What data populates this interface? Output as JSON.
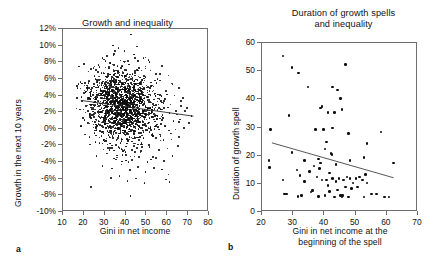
{
  "figure": {
    "panel_letters": {
      "a": "a",
      "b": "b"
    }
  },
  "chart_data": [
    {
      "type": "scatter",
      "panel": "a",
      "title": "Growth and inequality",
      "xlabel": "Gini in net income",
      "ylabel": "Growth in the next 10 years",
      "xlim": [
        10,
        80
      ],
      "ylim": [
        -10,
        12
      ],
      "grid": false,
      "legend": "none",
      "xticks": [
        10,
        20,
        30,
        40,
        50,
        60,
        70,
        80
      ],
      "xticklabels": [
        "10",
        "20",
        "30",
        "40",
        "50",
        "60",
        "70",
        "80"
      ],
      "yticks": [
        -10,
        -8,
        -6,
        -4,
        -2,
        0,
        2,
        4,
        6,
        8,
        10,
        12
      ],
      "yticklabels": [
        "-10%",
        "-8%",
        "-6%",
        "-4%",
        "-2%",
        "0%",
        "2%",
        "4%",
        "6%",
        "8%",
        "10%",
        "12%"
      ],
      "trendline": {
        "x": [
          19,
          73
        ],
        "y": [
          3.3,
          1.4
        ]
      },
      "point_count_approx": 1600,
      "cloud": {
        "x_center": 39,
        "x_spread": 8.5,
        "x_min": 17,
        "x_max": 73,
        "y_center": 2.4,
        "y_spread": 2.2,
        "y_min": -8.2,
        "y_max": 11.2
      },
      "points": [
        [
          43.0,
          11.2
        ],
        [
          34.5,
          9.9
        ],
        [
          37.0,
          9.6
        ],
        [
          46.0,
          9.8
        ],
        [
          30.0,
          8.2
        ],
        [
          31.5,
          8.6
        ],
        [
          35.0,
          8.9
        ],
        [
          40.0,
          9.2
        ],
        [
          44.5,
          8.8
        ],
        [
          49.0,
          8.4
        ],
        [
          28.0,
          7.3
        ],
        [
          33.0,
          7.8
        ],
        [
          38.0,
          8.1
        ],
        [
          42.0,
          7.6
        ],
        [
          47.0,
          7.2
        ],
        [
          52.0,
          7.9
        ],
        [
          58.0,
          7.4
        ],
        [
          25.5,
          6.2
        ],
        [
          29.0,
          6.6
        ],
        [
          36.0,
          6.9
        ],
        [
          41.0,
          6.4
        ],
        [
          45.0,
          6.8
        ],
        [
          50.0,
          6.1
        ],
        [
          55.0,
          6.5
        ],
        [
          61.0,
          6.3
        ],
        [
          22.0,
          5.1
        ],
        [
          27.0,
          5.6
        ],
        [
          32.0,
          5.4
        ],
        [
          39.0,
          5.8
        ],
        [
          43.5,
          5.2
        ],
        [
          48.0,
          5.5
        ],
        [
          53.0,
          5.0
        ],
        [
          57.0,
          5.7
        ],
        [
          63.0,
          5.3
        ],
        [
          66.0,
          4.8
        ],
        [
          20.5,
          4.2
        ],
        [
          24.0,
          4.6
        ],
        [
          28.5,
          4.4
        ],
        [
          33.5,
          4.9
        ],
        [
          38.5,
          4.3
        ],
        [
          42.5,
          4.7
        ],
        [
          47.5,
          4.1
        ],
        [
          51.0,
          4.5
        ],
        [
          56.0,
          4.0
        ],
        [
          60.0,
          4.4
        ],
        [
          64.0,
          3.9
        ],
        [
          68.0,
          3.6
        ],
        [
          19.5,
          3.2
        ],
        [
          23.0,
          3.6
        ],
        [
          26.5,
          3.4
        ],
        [
          30.5,
          3.8
        ],
        [
          34.0,
          3.1
        ],
        [
          37.5,
          3.5
        ],
        [
          41.5,
          3.3
        ],
        [
          45.5,
          3.7
        ],
        [
          49.5,
          3.0
        ],
        [
          54.0,
          3.4
        ],
        [
          59.0,
          3.2
        ],
        [
          62.0,
          2.8
        ],
        [
          67.0,
          2.6
        ],
        [
          70.0,
          2.4
        ],
        [
          18.5,
          2.2
        ],
        [
          21.5,
          2.6
        ],
        [
          25.0,
          2.4
        ],
        [
          29.5,
          2.8
        ],
        [
          32.5,
          2.1
        ],
        [
          36.5,
          2.5
        ],
        [
          40.5,
          2.3
        ],
        [
          44.0,
          2.7
        ],
        [
          48.5,
          2.0
        ],
        [
          52.5,
          2.4
        ],
        [
          57.5,
          2.2
        ],
        [
          61.5,
          1.8
        ],
        [
          65.0,
          1.6
        ],
        [
          69.0,
          2.0
        ],
        [
          72.0,
          1.4
        ],
        [
          20.0,
          1.2
        ],
        [
          24.5,
          1.6
        ],
        [
          27.5,
          1.4
        ],
        [
          31.0,
          1.8
        ],
        [
          35.5,
          1.1
        ],
        [
          39.5,
          1.5
        ],
        [
          43.0,
          1.3
        ],
        [
          46.5,
          1.7
        ],
        [
          50.5,
          1.0
        ],
        [
          54.5,
          1.4
        ],
        [
          58.5,
          1.2
        ],
        [
          63.5,
          0.8
        ],
        [
          66.5,
          1.0
        ],
        [
          71.0,
          0.6
        ],
        [
          19.0,
          0.2
        ],
        [
          22.5,
          0.6
        ],
        [
          26.0,
          0.4
        ],
        [
          30.0,
          0.8
        ],
        [
          34.5,
          0.1
        ],
        [
          38.0,
          0.5
        ],
        [
          42.0,
          0.3
        ],
        [
          46.0,
          0.7
        ],
        [
          51.5,
          0.0
        ],
        [
          55.5,
          0.4
        ],
        [
          59.5,
          0.2
        ],
        [
          64.5,
          -0.2
        ],
        [
          68.5,
          0.0
        ],
        [
          21.0,
          -0.8
        ],
        [
          25.5,
          -0.6
        ],
        [
          29.0,
          -1.0
        ],
        [
          33.0,
          -0.4
        ],
        [
          37.0,
          -0.9
        ],
        [
          41.0,
          -0.7
        ],
        [
          45.0,
          -1.2
        ],
        [
          49.0,
          -0.5
        ],
        [
          53.5,
          -1.0
        ],
        [
          57.0,
          -0.8
        ],
        [
          62.5,
          -1.4
        ],
        [
          66.0,
          -1.1
        ],
        [
          23.5,
          -2.0
        ],
        [
          28.0,
          -1.8
        ],
        [
          32.0,
          -2.4
        ],
        [
          36.0,
          -2.1
        ],
        [
          40.0,
          -2.6
        ],
        [
          44.5,
          -2.2
        ],
        [
          48.0,
          -2.8
        ],
        [
          52.0,
          -2.3
        ],
        [
          56.5,
          -2.7
        ],
        [
          60.5,
          -2.5
        ],
        [
          65.5,
          -2.2
        ],
        [
          26.5,
          -3.4
        ],
        [
          31.5,
          -3.1
        ],
        [
          35.0,
          -3.7
        ],
        [
          39.0,
          -3.3
        ],
        [
          43.5,
          -3.9
        ],
        [
          47.0,
          -3.5
        ],
        [
          51.0,
          -4.1
        ],
        [
          55.0,
          -3.6
        ],
        [
          59.0,
          -4.0
        ],
        [
          63.0,
          -3.4
        ],
        [
          29.5,
          -4.6
        ],
        [
          34.0,
          -4.9
        ],
        [
          38.5,
          -4.4
        ],
        [
          42.5,
          -5.1
        ],
        [
          46.5,
          -4.7
        ],
        [
          50.0,
          -5.3
        ],
        [
          54.0,
          -4.8
        ],
        [
          58.0,
          -5.0
        ],
        [
          61.0,
          -5.6
        ],
        [
          33.5,
          -6.0
        ],
        [
          37.5,
          -5.8
        ],
        [
          41.5,
          -6.4
        ],
        [
          45.5,
          -6.1
        ],
        [
          49.5,
          -6.6
        ],
        [
          60.0,
          -6.2
        ],
        [
          61.5,
          -6.5
        ],
        [
          24.0,
          -7.1
        ],
        [
          42.8,
          -8.2
        ]
      ]
    },
    {
      "type": "scatter",
      "panel": "b",
      "title": "Duration of growth spells and inequality",
      "title_lines": [
        "Duration of growth spells",
        "and inequality"
      ],
      "xlabel": "Gini in net income at the beginning of the spell",
      "xlabel_lines": [
        "Gini in net income at the",
        "beginning of the spell"
      ],
      "ylabel": "Duration of growth spell",
      "xlim": [
        20,
        70
      ],
      "ylim": [
        0,
        60
      ],
      "grid": false,
      "legend": "none",
      "xticks": [
        20,
        30,
        40,
        50,
        60,
        70
      ],
      "xticklabels": [
        "20",
        "30",
        "40",
        "50",
        "60",
        "70"
      ],
      "yticks": [
        0,
        10,
        20,
        30,
        40,
        50,
        60
      ],
      "yticklabels": [
        "0",
        "10",
        "20",
        "30",
        "40",
        "50",
        "60"
      ],
      "trendline": {
        "x": [
          23.5,
          62.5
        ],
        "y": [
          24.2,
          11.8
        ]
      },
      "points": [
        [
          27.0,
          55.0
        ],
        [
          30.0,
          51.0
        ],
        [
          32.0,
          49.0
        ],
        [
          47.0,
          52.0
        ],
        [
          35.0,
          44.0
        ],
        [
          43.0,
          44.0
        ],
        [
          44.5,
          43.0
        ],
        [
          45.5,
          40.0
        ],
        [
          29.0,
          34.0
        ],
        [
          39.0,
          36.5
        ],
        [
          39.5,
          37.0
        ],
        [
          41.5,
          35.0
        ],
        [
          43.5,
          35.0
        ],
        [
          46.0,
          36.0
        ],
        [
          23.0,
          29.0
        ],
        [
          37.5,
          29.0
        ],
        [
          40.0,
          29.0
        ],
        [
          43.0,
          29.5
        ],
        [
          48.0,
          27.5
        ],
        [
          58.5,
          28.0
        ],
        [
          41.0,
          24.5
        ],
        [
          54.0,
          24.0
        ],
        [
          40.5,
          22.0
        ],
        [
          42.5,
          20.5
        ],
        [
          42.8,
          20.0
        ],
        [
          30.0,
          20.8
        ],
        [
          34.0,
          18.0
        ],
        [
          38.5,
          18.5
        ],
        [
          39.0,
          17.0
        ],
        [
          22.5,
          18.0
        ],
        [
          22.8,
          15.5
        ],
        [
          31.5,
          14.5
        ],
        [
          35.5,
          14.0
        ],
        [
          48.5,
          18.0
        ],
        [
          53.0,
          19.0
        ],
        [
          62.5,
          17.0
        ],
        [
          27.0,
          11.0
        ],
        [
          32.5,
          12.5
        ],
        [
          34.0,
          10.5
        ],
        [
          38.0,
          12.0
        ],
        [
          39.5,
          11.0
        ],
        [
          41.0,
          11.0
        ],
        [
          42.0,
          13.5
        ],
        [
          43.0,
          11.5
        ],
        [
          44.0,
          10.5
        ],
        [
          45.0,
          11.5
        ],
        [
          46.5,
          11.0
        ],
        [
          47.5,
          12.0
        ],
        [
          48.5,
          11.5
        ],
        [
          49.5,
          10.0
        ],
        [
          50.5,
          11.5
        ],
        [
          51.5,
          12.0
        ],
        [
          52.5,
          11.0
        ],
        [
          53.5,
          13.0
        ],
        [
          54.0,
          10.0
        ],
        [
          47.0,
          8.5
        ],
        [
          49.0,
          8.0
        ],
        [
          51.0,
          8.5
        ],
        [
          44.5,
          7.5
        ],
        [
          42.0,
          7.0
        ],
        [
          36.0,
          6.8
        ],
        [
          36.5,
          7.2
        ],
        [
          33.0,
          5.5
        ],
        [
          31.8,
          5.2
        ],
        [
          27.5,
          6.0
        ],
        [
          28.2,
          6.0
        ],
        [
          38.5,
          5.2
        ],
        [
          40.5,
          5.5
        ],
        [
          43.5,
          5.0
        ],
        [
          45.5,
          5.5
        ],
        [
          46.0,
          5.0
        ],
        [
          46.2,
          5.4
        ],
        [
          48.0,
          5.0
        ],
        [
          55.5,
          6.0
        ],
        [
          57.0,
          6.0
        ],
        [
          59.5,
          5.0
        ],
        [
          61.0,
          5.0
        ],
        [
          53.0,
          5.0
        ],
        [
          41.5,
          9.0
        ],
        [
          44.0,
          16.5
        ],
        [
          37.0,
          16.0
        ],
        [
          38.8,
          15.0
        ]
      ]
    }
  ]
}
